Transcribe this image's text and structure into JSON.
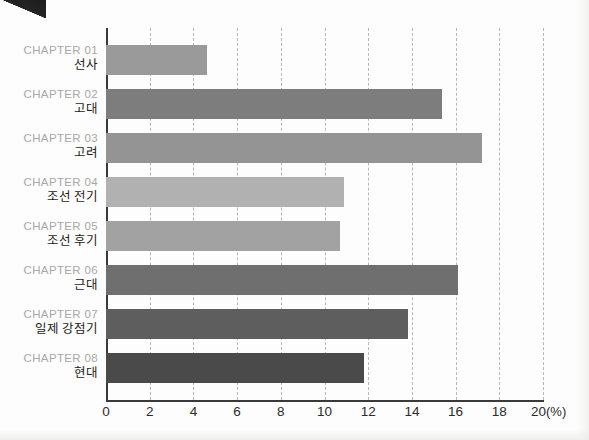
{
  "chart_data": {
    "type": "bar",
    "orientation": "horizontal",
    "title": "",
    "xlabel": "(%)",
    "ylabel": "",
    "xlim": [
      0,
      20
    ],
    "xticks": [
      0,
      2,
      4,
      6,
      8,
      10,
      12,
      14,
      16,
      18,
      20
    ],
    "xtick_labels": [
      "0",
      "2",
      "4",
      "6",
      "8",
      "10",
      "12",
      "14",
      "16",
      "18",
      "20"
    ],
    "unit_label": "(%)",
    "grid": "vertical-dashed",
    "legend": "none",
    "categories": [
      "CHAPTER 01 선사",
      "CHAPTER 02 고대",
      "CHAPTER 03 고려",
      "CHAPTER 04 조선 전기",
      "CHAPTER 05 조선 후기",
      "CHAPTER 06 근대",
      "CHAPTER 07 일제 강점기",
      "CHAPTER 08 현대"
    ],
    "values": [
      4.6,
      15.4,
      17.2,
      10.9,
      10.7,
      16.1,
      13.8,
      11.8
    ],
    "bars": [
      {
        "chapter": "CHAPTER 01",
        "name": "선사",
        "value": 4.6,
        "color": "#9a9a9a"
      },
      {
        "chapter": "CHAPTER 02",
        "name": "고대",
        "value": 15.4,
        "color": "#7d7d7d"
      },
      {
        "chapter": "CHAPTER 03",
        "name": "고려",
        "value": 17.2,
        "color": "#949494"
      },
      {
        "chapter": "CHAPTER 04",
        "name": "조선 전기",
        "value": 10.9,
        "color": "#b1b1b1"
      },
      {
        "chapter": "CHAPTER 05",
        "name": "조선 후기",
        "value": 10.7,
        "color": "#a2a2a2"
      },
      {
        "chapter": "CHAPTER 06",
        "name": "근대",
        "value": 16.1,
        "color": "#6f6f6f"
      },
      {
        "chapter": "CHAPTER 07",
        "name": "일제 강점기",
        "value": 13.8,
        "color": "#5e5e5e"
      },
      {
        "chapter": "CHAPTER 08",
        "name": "현대",
        "value": 11.8,
        "color": "#4a4a4a"
      }
    ],
    "colors": {
      "axis": "#3a3a3a",
      "gridline": "#b9b9b9",
      "chapter_label": "#a8a8a8",
      "name_label": "#1b1b1b",
      "background": "#fdfdfd"
    }
  }
}
